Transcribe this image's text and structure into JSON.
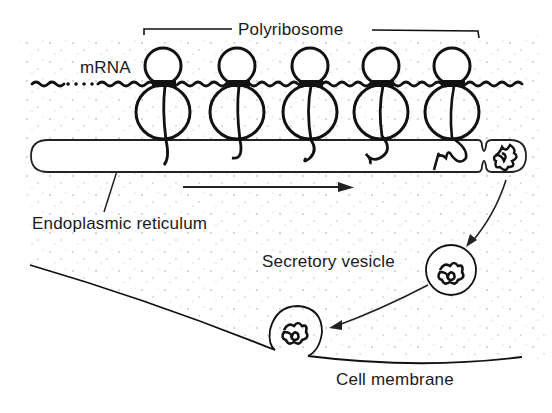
{
  "figure": {
    "labels": {
      "polyribosome": "Polyribosome",
      "mrna": "mRNA",
      "er": "Endoplasmic reticulum",
      "vesicle": "Secretory vesicle",
      "membrane": "Cell membrane"
    },
    "ribosome_count": 5,
    "colors": {
      "ink": "#111111",
      "background": "#ffffff",
      "stipple": "#9a9a9a"
    }
  }
}
